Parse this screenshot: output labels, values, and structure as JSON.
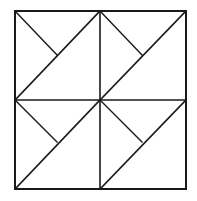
{
  "diagram": {
    "type": "geometric-dissection",
    "stroke_color": "#1a1a1a",
    "background_color": "#ffffff",
    "outer_square": {
      "x": 15,
      "y": 11,
      "width": 171,
      "height": 178
    },
    "midlines": {
      "vertical": {
        "x1": 100,
        "y1": 11,
        "x2": 100,
        "y2": 189
      },
      "horizontal": {
        "x1": 15,
        "y1": 100,
        "x2": 186,
        "y2": 100
      }
    },
    "quadrants": [
      {
        "name": "top-left",
        "diagonal": [
          15,
          100,
          100,
          11
        ],
        "short": [
          15,
          11,
          57,
          55
        ]
      },
      {
        "name": "top-right",
        "diagonal": [
          100,
          100,
          186,
          11
        ],
        "short": [
          100,
          11,
          142,
          55
        ]
      },
      {
        "name": "bottom-left",
        "diagonal": [
          15,
          189,
          100,
          100
        ],
        "short": [
          15,
          100,
          57,
          142
        ]
      },
      {
        "name": "bottom-right",
        "diagonal": [
          100,
          189,
          186,
          100
        ],
        "short": [
          100,
          100,
          142,
          142
        ]
      }
    ]
  }
}
